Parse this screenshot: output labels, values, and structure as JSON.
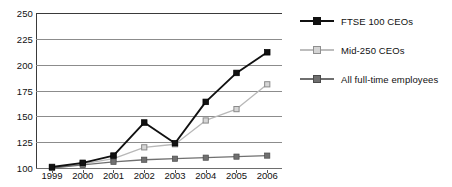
{
  "chart_data": {
    "type": "line",
    "title": "",
    "xlabel": "",
    "ylabel": "",
    "categories": [
      "1999",
      "2000",
      "2001",
      "2002",
      "2003",
      "2004",
      "2005",
      "2006"
    ],
    "x": [
      1999,
      2000,
      2001,
      2002,
      2003,
      2004,
      2005,
      2006
    ],
    "ylim": [
      100,
      250
    ],
    "yticks": [
      100,
      125,
      150,
      175,
      200,
      225,
      250
    ],
    "grid": true,
    "legend_position": "right",
    "series": [
      {
        "name": "FTSE 100 CEOs",
        "color": "#111111",
        "marker": "filled-square",
        "values": [
          101,
          105,
          112,
          144,
          124,
          164,
          192,
          212
        ]
      },
      {
        "name": "Mid-250 CEOs",
        "color": "#b8b8b8",
        "marker": "open-square",
        "values": [
          100,
          104,
          109,
          120,
          123,
          146,
          157,
          181
        ]
      },
      {
        "name": "All full-time employees",
        "color": "#707070",
        "marker": "filled-square",
        "values": [
          100,
          103,
          106,
          108,
          109,
          110,
          111,
          112
        ]
      }
    ]
  },
  "axis": {
    "ytick_labels": [
      "250",
      "225",
      "200",
      "175",
      "150",
      "125",
      "100"
    ],
    "xtick_labels": [
      "1999",
      "2000",
      "2001",
      "2002",
      "2003",
      "2004",
      "2005",
      "2006"
    ]
  },
  "legend": {
    "items": [
      {
        "label": "FTSE 100 CEOs",
        "color": "#111111",
        "marker_fill": "#111111",
        "marker_border": "#111111"
      },
      {
        "label": "Mid-250 CEOs",
        "color": "#bdbdbd",
        "marker_fill": "#d4d4d4",
        "marker_border": "#8f8f8f"
      },
      {
        "label": "All full-time employees",
        "color": "#6f6f6f",
        "marker_fill": "#6f6f6f",
        "marker_border": "#4a4a4a"
      }
    ]
  }
}
